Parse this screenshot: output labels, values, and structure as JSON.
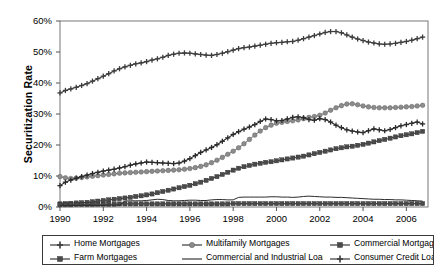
{
  "chart_data": {
    "type": "line",
    "title": "",
    "xlabel": "",
    "ylabel": "Securitization Rate",
    "ylim": [
      0,
      60
    ],
    "xlim": [
      1990,
      2007
    ],
    "ytick_labels": [
      "0%",
      "10%",
      "20%",
      "30%",
      "40%",
      "50%",
      "60%"
    ],
    "ytick_values": [
      0,
      10,
      20,
      30,
      40,
      50,
      60
    ],
    "xtick_labels": [
      "1990",
      "1992",
      "1994",
      "1996",
      "1998",
      "2000",
      "2002",
      "2004",
      "2006"
    ],
    "xtick_values": [
      1990,
      1992,
      1994,
      1996,
      1998,
      2000,
      2002,
      2004,
      2006
    ],
    "grid": false,
    "legend_position": "bottom",
    "x": [
      1990.0,
      1990.25,
      1990.5,
      1990.75,
      1991.0,
      1991.25,
      1991.5,
      1991.75,
      1992.0,
      1992.25,
      1992.5,
      1992.75,
      1993.0,
      1993.25,
      1993.5,
      1993.75,
      1994.0,
      1994.25,
      1994.5,
      1994.75,
      1995.0,
      1995.25,
      1995.5,
      1995.75,
      1996.0,
      1996.25,
      1996.5,
      1996.75,
      1997.0,
      1997.25,
      1997.5,
      1997.75,
      1998.0,
      1998.25,
      1998.5,
      1998.75,
      1999.0,
      1999.25,
      1999.5,
      1999.75,
      2000.0,
      2000.25,
      2000.5,
      2000.75,
      2001.0,
      2001.25,
      2001.5,
      2001.75,
      2002.0,
      2002.25,
      2002.5,
      2002.75,
      2003.0,
      2003.25,
      2003.5,
      2003.75,
      2004.0,
      2004.25,
      2004.5,
      2004.75,
      2005.0,
      2005.25,
      2005.5,
      2005.75,
      2006.0,
      2006.25,
      2006.5,
      2006.75
    ],
    "series": [
      {
        "name": "Home Mortgages",
        "marker": "cross",
        "color": "#3d3d3d",
        "values": [
          36.8,
          37.6,
          38.1,
          38.6,
          39.2,
          39.8,
          40.6,
          41.4,
          42.2,
          43.0,
          43.9,
          44.6,
          45.2,
          45.7,
          46.2,
          46.5,
          46.9,
          47.4,
          47.8,
          48.3,
          48.9,
          49.3,
          49.6,
          49.7,
          49.6,
          49.4,
          49.2,
          49.0,
          48.9,
          49.2,
          49.6,
          50.1,
          50.6,
          51.1,
          51.4,
          51.6,
          51.9,
          52.2,
          52.5,
          52.8,
          53.0,
          53.1,
          53.3,
          53.4,
          53.8,
          54.3,
          54.8,
          55.3,
          55.8,
          56.3,
          56.6,
          56.6,
          56.2,
          55.5,
          54.8,
          54.2,
          53.7,
          53.2,
          52.9,
          52.6,
          52.5,
          52.6,
          52.8,
          53.1,
          53.4,
          53.8,
          54.3,
          54.8
        ]
      },
      {
        "name": "Multifamily Mortgages",
        "marker": "circle",
        "color": "#8c8c8c",
        "values": [
          9.8,
          9.4,
          9.2,
          9.3,
          9.5,
          9.7,
          9.9,
          10.1,
          10.3,
          10.5,
          10.7,
          10.9,
          11.0,
          11.1,
          11.2,
          11.3,
          11.4,
          11.5,
          11.6,
          11.7,
          11.8,
          11.9,
          12.0,
          12.2,
          12.4,
          12.7,
          13.1,
          13.6,
          14.3,
          15.1,
          16.0,
          17.0,
          18.0,
          19.1,
          20.4,
          21.8,
          23.2,
          24.5,
          25.6,
          26.4,
          27.0,
          27.3,
          27.6,
          27.8,
          28.1,
          28.5,
          28.9,
          29.2,
          29.6,
          30.3,
          31.2,
          32.0,
          32.7,
          33.2,
          33.3,
          33.0,
          32.6,
          32.3,
          32.1,
          32.0,
          32.0,
          32.0,
          32.1,
          32.2,
          32.3,
          32.4,
          32.6,
          32.8
        ]
      },
      {
        "name": "Commercial Mortgages",
        "marker": "square",
        "color": "#4a4a4a",
        "values": [
          1.0,
          1.1,
          1.2,
          1.3,
          1.4,
          1.5,
          1.7,
          1.9,
          2.1,
          2.3,
          2.5,
          2.7,
          2.9,
          3.1,
          3.4,
          3.6,
          3.9,
          4.2,
          4.6,
          5.0,
          5.4,
          5.8,
          6.2,
          6.6,
          7.0,
          7.5,
          8.0,
          8.6,
          9.2,
          9.8,
          10.5,
          11.2,
          11.9,
          12.5,
          13.0,
          13.4,
          13.8,
          14.1,
          14.4,
          14.6,
          14.9,
          15.2,
          15.5,
          15.8,
          16.1,
          16.4,
          16.8,
          17.2,
          17.6,
          18.0,
          18.4,
          18.8,
          19.1,
          19.4,
          19.6,
          19.9,
          20.2,
          20.6,
          21.0,
          21.4,
          21.8,
          22.2,
          22.6,
          23.0,
          23.3,
          23.6,
          24.0,
          24.4
        ]
      },
      {
        "name": "Farm Mortgages",
        "marker": "square",
        "color": "#4a4a4a",
        "values": [
          0.7,
          0.7,
          0.7,
          0.8,
          0.8,
          0.8,
          0.8,
          0.9,
          0.9,
          0.9,
          0.9,
          1.0,
          1.0,
          1.0,
          1.0,
          1.0,
          1.0,
          1.0,
          1.0,
          1.0,
          1.0,
          1.0,
          1.0,
          1.0,
          1.0,
          1.0,
          1.0,
          1.0,
          1.0,
          1.0,
          1.0,
          1.0,
          1.1,
          1.1,
          1.1,
          1.1,
          1.1,
          1.1,
          1.1,
          1.1,
          1.1,
          1.1,
          1.1,
          1.1,
          1.1,
          1.1,
          1.1,
          1.1,
          1.1,
          1.1,
          1.1,
          1.1,
          1.1,
          1.1,
          1.1,
          1.1,
          1.1,
          1.1,
          1.1,
          1.1,
          1.1,
          1.1,
          1.1,
          1.1,
          1.1,
          1.1,
          1.1,
          1.1
        ]
      },
      {
        "name": "Commercial and Industrial Loans",
        "marker": "none",
        "color": "#2b2b2b",
        "values": [
          0.5,
          0.5,
          0.5,
          0.5,
          0.5,
          0.5,
          0.5,
          0.5,
          0.5,
          0.6,
          0.6,
          0.6,
          1.9,
          2.0,
          2.0,
          2.0,
          2.1,
          2.3,
          2.5,
          2.4,
          2.1,
          2.0,
          2.0,
          2.1,
          2.2,
          2.2,
          2.1,
          2.1,
          2.3,
          2.4,
          2.4,
          2.3,
          2.3,
          3.1,
          3.2,
          3.2,
          3.2,
          3.2,
          3.2,
          3.3,
          3.3,
          3.2,
          3.2,
          3.1,
          3.2,
          3.4,
          3.5,
          3.4,
          3.3,
          3.2,
          3.2,
          3.1,
          3.1,
          3.0,
          2.9,
          2.8,
          2.7,
          2.6,
          2.5,
          2.5,
          2.4,
          2.4,
          2.3,
          2.3,
          2.2,
          2.1,
          2.0,
          1.9
        ]
      },
      {
        "name": "Consumer Credit Loans",
        "marker": "cross",
        "color": "#2b2b2b",
        "values": [
          6.9,
          8.0,
          8.7,
          9.3,
          9.8,
          10.3,
          10.8,
          11.2,
          11.6,
          11.9,
          12.2,
          12.6,
          13.0,
          13.5,
          13.9,
          14.2,
          14.5,
          14.4,
          14.3,
          14.2,
          14.1,
          14.0,
          14.2,
          14.8,
          15.6,
          16.6,
          17.6,
          18.4,
          19.2,
          20.1,
          21.2,
          22.3,
          23.4,
          24.3,
          25.1,
          25.8,
          26.6,
          27.6,
          28.4,
          28.2,
          27.8,
          27.9,
          28.4,
          28.9,
          29.1,
          28.8,
          28.2,
          28.0,
          28.5,
          28.2,
          27.4,
          26.4,
          25.6,
          24.9,
          24.5,
          24.2,
          24.0,
          24.6,
          25.2,
          24.9,
          24.6,
          25.0,
          25.6,
          26.2,
          26.6,
          27.0,
          27.4,
          26.8
        ]
      }
    ]
  },
  "legend": {
    "entries": [
      {
        "label": "Home Mortgages",
        "marker": "cross"
      },
      {
        "label": "Multifamily Mortgages",
        "marker": "circle"
      },
      {
        "label": "Commercial Mortgages",
        "marker": "square"
      },
      {
        "label": "Farm Mortgages",
        "marker": "square"
      },
      {
        "label": "Commercial and Industrial Loans",
        "marker": "none"
      },
      {
        "label": "Consumer Credit Loans",
        "marker": "cross"
      }
    ]
  }
}
